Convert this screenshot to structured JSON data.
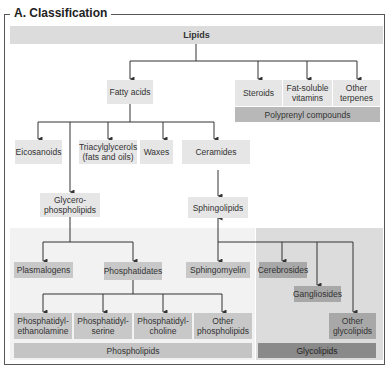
{
  "title": "A. Classification",
  "nodes": {
    "lipids": "Lipids",
    "fatty_acids": "Fatty acids",
    "steroids": "Steroids",
    "fat_soluble_vitamins": "Fat-soluble vitamins",
    "other_terpenes": "Other terpenes",
    "polyprenyl_compounds": "Polyprenyl compounds",
    "eicosanoids": "Eicosanoids",
    "triacylglycerols": "Triacylglycerols (fats and oils)",
    "waxes": "Waxes",
    "ceramides": "Ceramides",
    "glycerophospholipids": "Glycero-phospholipids",
    "sphingolipids": "Sphingolipids",
    "plasmalogens": "Plasmalogens",
    "phosphatidates": "Phosphatidates",
    "sphingomyelin": "Sphingomyelin",
    "cerebrosides": "Cerebrosides",
    "gangliosides": "Gangliosides",
    "other_glycolipids": "Other glycolipids",
    "phosphatidyl_ethanolamine": "Phosphatidyl-ethanolamine",
    "phosphatidyl_serine": "Phosphatidyl-serine",
    "phosphatidyl_choline": "Phosphatidyl-choline",
    "other_phospholipids": "Other phospholipids",
    "phospholipids": "Phospholipids",
    "glycolipids": "Glycolipids"
  },
  "colors": {
    "light_box": "#e6e6e6",
    "mid_box": "#b8b8b8",
    "dark_box": "#8a8a8a",
    "region_phospholipid": "#f2f2f2",
    "region_glycolipid": "#dcdcdc",
    "line": "#333333"
  }
}
